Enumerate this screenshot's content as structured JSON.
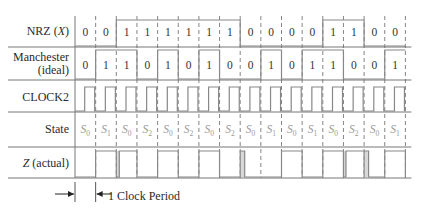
{
  "rows": {
    "nrz": {
      "label": "NRZ (",
      "label_var": "X",
      "label_end": ")"
    },
    "manchester": {
      "label_line1": "Manchester",
      "label_line2": "(ideal)"
    },
    "clock": {
      "label": "CLOCK2"
    },
    "state": {
      "label": "State"
    },
    "z": {
      "label_var": "Z",
      "label_rest": " (actual)"
    }
  },
  "period_annotation": "1 Clock Period",
  "colors": {
    "line": "#888888",
    "dash": "#666666",
    "glitch": "#d8d8d8",
    "state_text": "#9a9a9a"
  },
  "chart_data": {
    "type": "timing",
    "columns": 16,
    "nrz_x": [
      0,
      0,
      1,
      1,
      1,
      1,
      1,
      1,
      0,
      0,
      0,
      0,
      1,
      1,
      0,
      0
    ],
    "manchester_ideal": [
      0,
      1,
      1,
      0,
      1,
      0,
      1,
      0,
      0,
      1,
      0,
      1,
      1,
      0,
      0,
      1
    ],
    "clock2": "pulse high in second half of each bit column",
    "state": [
      "S0",
      "S1",
      "S0",
      "S2",
      "S0",
      "S2",
      "S0",
      "S2",
      "S0",
      "S1",
      "S0",
      "S1",
      "S0",
      "S2",
      "S0",
      "S1"
    ],
    "z_actual_high_columns": [
      1,
      2,
      4,
      6,
      10,
      12,
      13,
      15
    ],
    "z_actual_glitches_columns": [
      2,
      8,
      13,
      14
    ]
  }
}
